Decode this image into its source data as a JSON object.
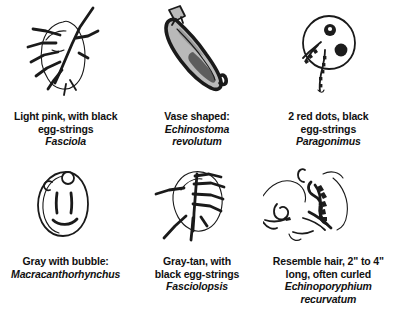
{
  "page": {
    "background_color": "#ffffff",
    "ink_color": "#1a1a1a",
    "width": 394,
    "height": 323
  },
  "rows": [
    {
      "name": "top-row",
      "cells": [
        {
          "id": "cell-fasciola",
          "figure_name": "fasciola-drawing",
          "figure_description": "leaf-shaped flatworm outline with dark branching egg-strings",
          "caption_lines": [
            "Light pink, with black",
            "egg-strings"
          ],
          "species": "Fasciola"
        },
        {
          "id": "cell-echinostoma",
          "figure_name": "echinostoma-drawing",
          "figure_description": "vase or pod shape tilted diagonally, dark outline with gray interior and narrow neck",
          "caption_lines": [
            "Vase shaped:"
          ],
          "species": "Echinostoma revolutum",
          "species_lines": [
            "Echinostoma",
            "revolutum"
          ]
        },
        {
          "id": "cell-paragonimus",
          "figure_name": "paragonimus-drawing",
          "figure_description": "round cell with two dark red dots and squiggly egg-strings trailing from lower-left",
          "caption_lines": [
            "2 red dots, black",
            "egg-strings"
          ],
          "species": "Paragonimus"
        }
      ]
    },
    {
      "name": "bottom-row",
      "cells": [
        {
          "id": "cell-macracanthorhynchus",
          "figure_name": "macracanthorhynchus-drawing",
          "figure_description": "gray egg-shaped body with small bubble circle at top, two vertical marks and a curved smile line",
          "caption_lines": [
            "Gray with bubble:"
          ],
          "species": "Macracanthorhynchus"
        },
        {
          "id": "cell-fasciolopsis",
          "figure_name": "fasciolopsis-drawing",
          "figure_description": "irregular gray-tan blob with thick straight black egg-strings radiating outward",
          "caption_lines": [
            "Gray-tan, with",
            "black egg-strings"
          ],
          "species": "Fasciolopsis"
        },
        {
          "id": "cell-echinoporyphium",
          "figure_name": "echinoporyphium-drawing",
          "figure_description": "curly hair-like strands and squiggles resembling coiled hairs",
          "caption_lines": [
            "Resemble hair, 2\" to 4\"",
            "long, often curled"
          ],
          "species": "Echinoporyphium recurvatum",
          "species_lines": [
            "Echinoporyphium",
            "recurvatum"
          ]
        }
      ]
    }
  ]
}
